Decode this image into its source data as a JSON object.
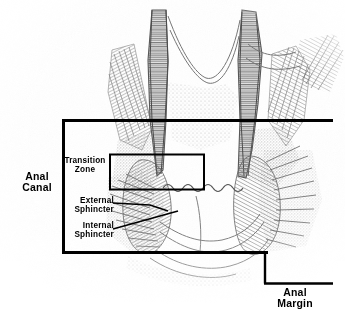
{
  "figure": {
    "background_color": "#ffffff",
    "line_color": "#000000",
    "illustration_ink_color": "#5b5b5b"
  },
  "labels": {
    "anal_canal": "Anal\nCanal",
    "transition_zone": "Transition\nZone",
    "external_sphincter": "External\nSphincter",
    "internal_sphincter": "Internal\nSphincter",
    "anal_margin": "Anal\nMargin"
  },
  "annotations": {
    "anal_canal_box": {
      "name": "anal-canal-boundary-box",
      "x": 62,
      "y": 119,
      "width": 266,
      "height": 135,
      "stroke_width": 3
    },
    "transition_zone_box": {
      "name": "transition-zone-box",
      "x": 110,
      "y": 154,
      "width": 95,
      "height": 36,
      "stroke_width": 2
    },
    "anal_margin_bracket": {
      "name": "anal-margin-bracket",
      "vertical_x": 264,
      "top_y": 254,
      "bottom_y": 283,
      "right_x": 333,
      "stroke_width": 2
    },
    "leader_lines": [
      {
        "name": "external-sphincter-leader",
        "x1": 113,
        "y1": 203,
        "x2": 166,
        "y2": 209
      },
      {
        "name": "internal-sphincter-leader",
        "x1": 113,
        "y1": 228,
        "x2": 176,
        "y2": 212
      }
    ]
  }
}
